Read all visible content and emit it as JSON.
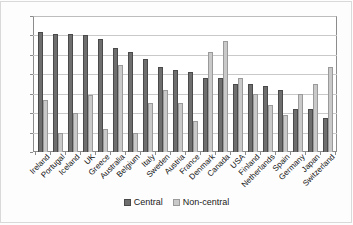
{
  "figure": {
    "background": "#ffffff",
    "frame_color": "#d9d9d9"
  },
  "legend": {
    "position": "bottom-center",
    "items": [
      {
        "label": "Central",
        "color": "#6e6e6e",
        "swatch": "legend-swatch-central"
      },
      {
        "label": "Non-central",
        "color": "#c9c9c9",
        "swatch": "legend-swatch-noncentral"
      }
    ]
  },
  "chart_data": {
    "type": "bar",
    "title": "",
    "subtitle": "",
    "xlabel": "",
    "ylabel": "",
    "ylim": [
      0,
      70
    ],
    "ytick_step": 10,
    "yticks": [
      70,
      60,
      50,
      40,
      30,
      20,
      10,
      0
    ],
    "grid": true,
    "grid_axis": "y",
    "legend_position": "bottom-center",
    "bar_group_mode": "grouped",
    "categories": [
      "Ireland",
      "Portugal",
      "Iceland",
      "UK",
      "Greece",
      "Australia",
      "Belgium",
      "Italy",
      "Sweden",
      "Austria",
      "France",
      "Denmark",
      "Canada",
      "USA",
      "Finland",
      "Netherlands",
      "Spain",
      "Germany",
      "Japan",
      "Switzerland"
    ],
    "series": [
      {
        "name": "Central",
        "color": "#6e6e6e",
        "values": [
          62,
          61,
          61,
          60,
          58,
          53.5,
          51.5,
          48,
          44,
          42,
          41,
          38,
          38,
          35,
          35,
          34,
          32,
          22,
          22,
          17.5
        ]
      },
      {
        "name": "Non-central",
        "color": "#c9c9c9",
        "values": [
          27,
          10,
          20,
          29.5,
          12,
          45,
          10,
          25,
          32,
          25,
          16,
          51.5,
          57,
          38,
          30,
          24,
          19,
          30,
          35,
          44
        ]
      }
    ]
  }
}
